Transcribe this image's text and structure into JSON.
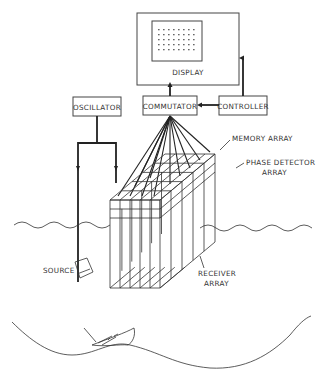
{
  "diagram": {
    "type": "block-and-illustration",
    "colors": {
      "line": "#222222",
      "text": "#333333",
      "background": "#ffffff"
    },
    "blocks": [
      {
        "id": "display",
        "label": "DISPLAY"
      },
      {
        "id": "oscillator",
        "label": "OSCILLATOR"
      },
      {
        "id": "commutator",
        "label": "COMMUTATOR"
      },
      {
        "id": "controller",
        "label": "CONTROLLER"
      }
    ],
    "annotations": {
      "memory_array": "MEMORY ARRAY",
      "phase_detector_line1": "PHASE DETECTOR",
      "phase_detector_line2": "ARRAY",
      "source": "SOURCE",
      "receiver_line1": "RECEIVER",
      "receiver_line2": "ARRAY"
    },
    "connections": [
      {
        "from": "commutator",
        "to": "display"
      },
      {
        "from": "controller",
        "to": "display"
      },
      {
        "from": "controller",
        "to": "commutator"
      },
      {
        "from": "phase_detector_array",
        "to": "commutator"
      },
      {
        "from": "oscillator",
        "to": "source"
      },
      {
        "from": "oscillator",
        "to": "phase_detector_array"
      }
    ],
    "display_grid": {
      "rows": 5,
      "cols": 8
    }
  }
}
